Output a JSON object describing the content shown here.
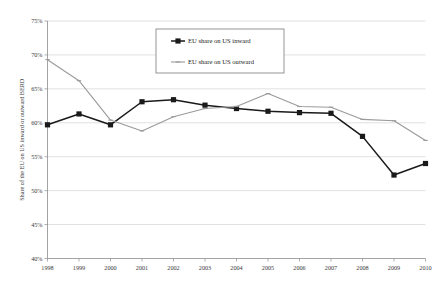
{
  "chart_data": {
    "type": "line",
    "title": "",
    "xlabel": "",
    "ylabel": "Share of the EU on US inward or outward BERD",
    "x": [
      1998,
      1999,
      2000,
      2001,
      2002,
      2003,
      2004,
      2005,
      2006,
      2007,
      2008,
      2009,
      2010
    ],
    "xticklabels": [
      "1998",
      "1999",
      "2000",
      "2001",
      "2002",
      "2003",
      "2004",
      "2005",
      "2006",
      "2007",
      "2008",
      "2009",
      "2010"
    ],
    "yticklabels": [
      "75%",
      "70%",
      "65%",
      "60%",
      "55%",
      "50%",
      "45%",
      "40%"
    ],
    "yticks": [
      75,
      70,
      65,
      60,
      55,
      50,
      45,
      40
    ],
    "ylim": [
      40,
      75
    ],
    "ytick_suffix": "%",
    "grid": true,
    "legend_position": "top-center",
    "series": [
      {
        "name": "EU share on US inward",
        "color": "#1a1a1a",
        "marker": "square",
        "values": [
          59.7,
          61.3,
          59.7,
          63.1,
          63.4,
          62.6,
          62.1,
          61.7,
          61.5,
          61.4,
          58.0,
          52.3,
          54.0
        ]
      },
      {
        "name": "EU share on US outward",
        "color": "#9a9a9a",
        "marker": "tick",
        "values": [
          69.3,
          66.2,
          60.4,
          58.8,
          60.9,
          62.1,
          62.4,
          64.3,
          62.4,
          62.3,
          60.5,
          60.3,
          57.4
        ]
      }
    ]
  },
  "legend": {
    "entries": [
      {
        "label": "EU share on US inward"
      },
      {
        "label": "EU share on US outward"
      }
    ]
  }
}
